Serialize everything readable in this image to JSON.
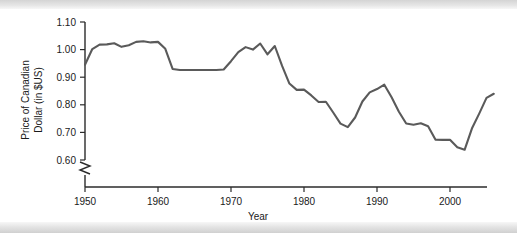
{
  "figure": {
    "background_color": "#ffffff",
    "band_color": "#e2e2e2",
    "line_color": "#5a5a5a",
    "axis_color": "#2b2b2b"
  },
  "chart_data": {
    "type": "line",
    "title": "",
    "xlabel": "Year",
    "ylabel": "Price of Canadian Dollar (in $US)",
    "ylabel_line1": "Price of Canadian",
    "ylabel_line2": "Dollar (in $US)",
    "xlim": [
      1949,
      2007
    ],
    "ylim": [
      0.6,
      1.1
    ],
    "xticks": [
      1950,
      1960,
      1970,
      1980,
      1990,
      2000
    ],
    "xtick_labels": [
      "1950",
      "1960",
      "1970",
      "1980",
      "1990",
      "2000"
    ],
    "yticks": [
      0.6,
      0.7,
      0.8,
      0.9,
      1.0,
      1.1
    ],
    "ytick_labels": [
      "0.60",
      "0.70",
      "0.80",
      "0.90",
      "1.00",
      "1.10"
    ],
    "grid": false,
    "legend": false,
    "axis_break": {
      "present": true,
      "axis": "y",
      "below_value": 0.6,
      "symbol": "zigzag"
    },
    "series": [
      {
        "name": "Price of Canadian Dollar (in $US)",
        "color": "#5a5a5a",
        "x": [
          1950,
          1951,
          1952,
          1953,
          1954,
          1955,
          1956,
          1957,
          1958,
          1959,
          1960,
          1961,
          1962,
          1963,
          1964,
          1965,
          1966,
          1967,
          1968,
          1969,
          1970,
          1971,
          1972,
          1973,
          1974,
          1975,
          1976,
          1977,
          1978,
          1979,
          1980,
          1981,
          1982,
          1983,
          1984,
          1985,
          1986,
          1987,
          1988,
          1989,
          1990,
          1991,
          1992,
          1993,
          1994,
          1995,
          1996,
          1997,
          1998,
          1999,
          2000,
          2001,
          2002,
          2003,
          2004,
          2005,
          2006
        ],
        "values": [
          0.945,
          1.002,
          1.018,
          1.019,
          1.023,
          1.01,
          1.016,
          1.028,
          1.03,
          1.026,
          1.028,
          1.003,
          0.93,
          0.926,
          0.926,
          0.926,
          0.926,
          0.926,
          0.926,
          0.928,
          0.958,
          0.991,
          1.009,
          1.0,
          1.022,
          0.983,
          1.013,
          0.941,
          0.877,
          0.854,
          0.855,
          0.834,
          0.81,
          0.811,
          0.772,
          0.732,
          0.719,
          0.754,
          0.812,
          0.845,
          0.857,
          0.873,
          0.827,
          0.775,
          0.732,
          0.728,
          0.733,
          0.722,
          0.674,
          0.673,
          0.673,
          0.646,
          0.637,
          0.714,
          0.768,
          0.825,
          0.84
        ]
      }
    ]
  }
}
